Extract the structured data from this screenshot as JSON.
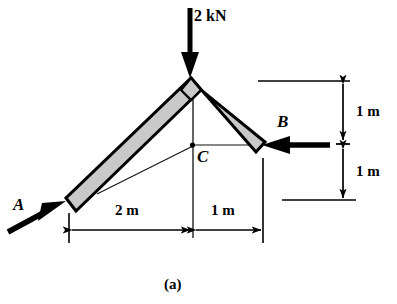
{
  "figure": {
    "caption": "(a)",
    "type": "statics-free-body-diagram"
  },
  "colors": {
    "ink": "#000000",
    "member_fill": "#c8c8c8",
    "member_edge": "#000000",
    "background": "#ffffff",
    "thin_line": "#1a1a1a"
  },
  "loads": [
    {
      "name": "applied-load",
      "label": "2 kN",
      "magnitude": 2,
      "unit": "kN",
      "direction": "down",
      "applied_at": "apex"
    },
    {
      "name": "force-at-a",
      "label": "A",
      "direction": "up-right",
      "applied_at": "A"
    },
    {
      "name": "force-at-b",
      "label": "B",
      "direction": "left",
      "applied_at": "B"
    }
  ],
  "points": [
    {
      "name": "point-a",
      "label": "A"
    },
    {
      "name": "point-b",
      "label": "B"
    },
    {
      "name": "point-c",
      "label": "C"
    }
  ],
  "dimensions": {
    "horizontal": [
      {
        "name": "dim-2m",
        "label": "2 m",
        "value": 2,
        "unit": "m"
      },
      {
        "name": "dim-1m-bottom",
        "label": "1 m",
        "value": 1,
        "unit": "m"
      }
    ],
    "vertical": [
      {
        "name": "dim-1m-upper",
        "label": "1 m",
        "value": 1,
        "unit": "m"
      },
      {
        "name": "dim-1m-lower",
        "label": "1 m",
        "value": 1,
        "unit": "m"
      }
    ]
  },
  "geometry": {
    "member_left": {
      "from": "A",
      "to": "apex"
    },
    "member_right": {
      "from": "apex",
      "to": "B"
    },
    "construction_lines": [
      {
        "name": "c-to-b-line"
      },
      {
        "name": "c-to-left-member-line"
      },
      {
        "name": "apex-vertical-centerline"
      }
    ]
  }
}
